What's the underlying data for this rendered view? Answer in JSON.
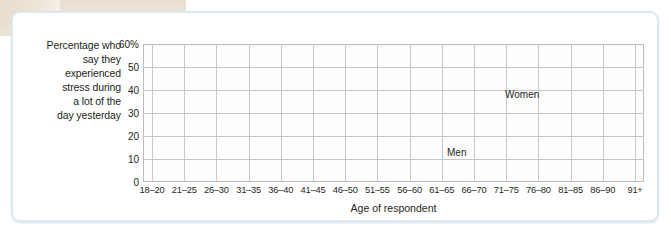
{
  "figure": {
    "y_axis_title_lines": [
      "Percentage who",
      "say they",
      "experienced",
      "stress during",
      "a lot of the",
      "day yesterday"
    ],
    "x_axis_title": "Age of respondent"
  },
  "colors": {
    "women_line": "#9a98cf",
    "men_line": "#a9cf8e",
    "grid": "#c3c6cd",
    "plot_border": "#b9bcc4",
    "text": "#231f20",
    "frame_border": "#dbe8ef",
    "scan_tan": "#e8dfd0"
  },
  "chart_data": {
    "type": "line",
    "title": "",
    "subtitle": "",
    "xlabel": "Age of respondent",
    "ylabel": "Percentage who say they experienced stress during a lot of the day yesterday",
    "categories": [
      "18–20",
      "21–25",
      "26–30",
      "31–35",
      "36–40",
      "41–45",
      "46–50",
      "51–55",
      "56–60",
      "61–65",
      "66–70",
      "71–75",
      "76–80",
      "81–85",
      "86–90",
      "91+"
    ],
    "series": [
      {
        "name": "Women",
        "color": "#9a98cf",
        "values": [
          48,
          53,
          51.5,
          51,
          50.5,
          48.5,
          47.5,
          46.5,
          41,
          36,
          27,
          24,
          21.5,
          19,
          17,
          14
        ]
      },
      {
        "name": "Men",
        "color": "#a9cf8e",
        "values": [
          39,
          44,
          44.5,
          45,
          43.5,
          48,
          45,
          42,
          37,
          31,
          20,
          17,
          15.5,
          15,
          14.5,
          13
        ]
      }
    ],
    "ylim": [
      0,
      60
    ],
    "yticks": [
      0,
      10,
      20,
      30,
      40,
      50,
      60
    ],
    "ytick_labels": [
      "0",
      "10",
      "20",
      "30",
      "40",
      "50",
      "60%"
    ],
    "grid": true,
    "legend_position": "inline-annotations",
    "annotations": [
      {
        "text": "Women",
        "series": "Women",
        "points_to_category": "66–70"
      },
      {
        "text": "Men",
        "series": "Men",
        "points_to_category": "66–70"
      }
    ]
  }
}
